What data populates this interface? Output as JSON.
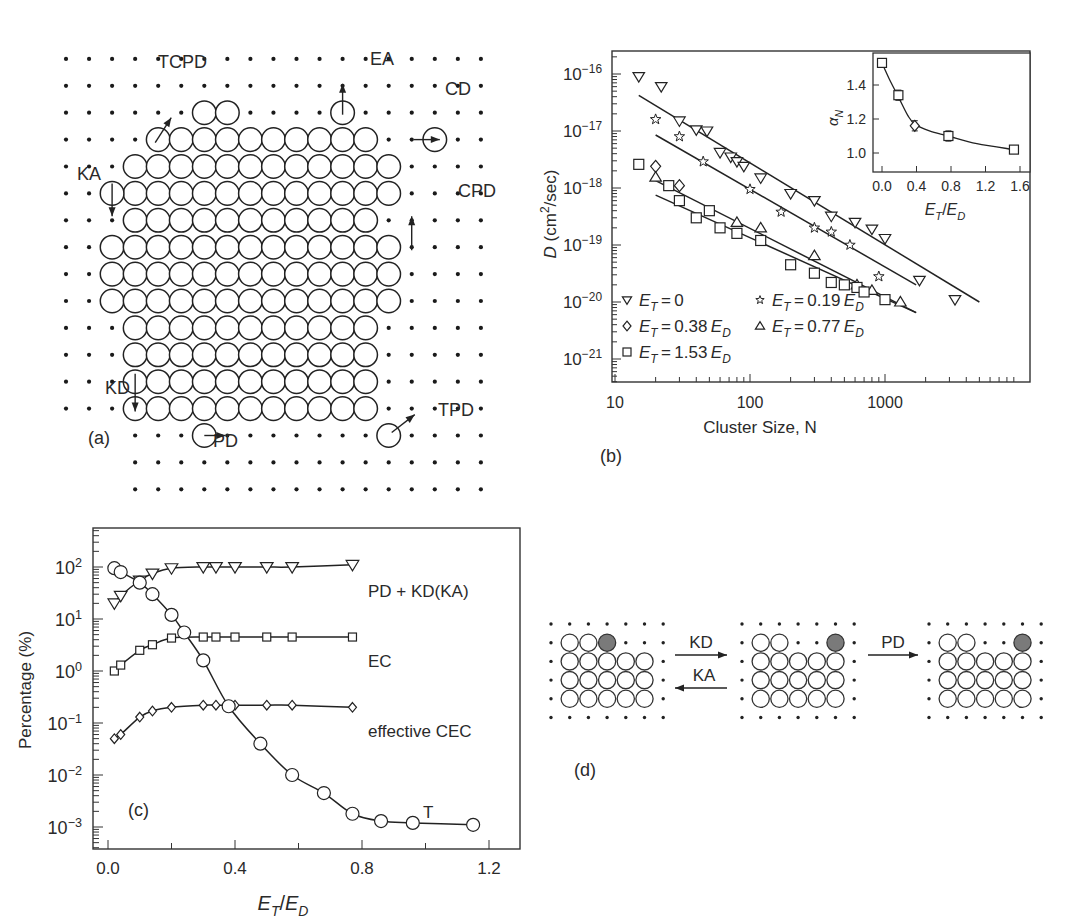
{
  "figure": {
    "panel_a": {
      "label": "(a)",
      "mechanisms": [
        "TCPD",
        "EA",
        "CD",
        "KA",
        "CPD",
        "KD",
        "PD",
        "TPD"
      ]
    },
    "panel_b": {
      "label": "(b)"
    },
    "panel_c": {
      "label": "(c)"
    },
    "panel_d": {
      "label": "(d)",
      "arrows": {
        "forward_1": "KD",
        "backward_1": "KA",
        "forward_2": "PD"
      }
    }
  },
  "chart_data": [
    {
      "panel": "b",
      "type": "scatter",
      "xscale": "log",
      "yscale": "log",
      "xlabel": "Cluster Size, N",
      "ylabel": "D (cm²/sec)",
      "xlim": [
        10,
        6000
      ],
      "ylim": [
        3e-22,
        2e-16
      ],
      "xticks": [
        "10",
        "100",
        "1000"
      ],
      "yticks": [
        "10⁻¹⁶",
        "10⁻¹⁷",
        "10⁻¹⁸",
        "10⁻¹⁹",
        "10⁻²⁰",
        "10⁻²¹"
      ],
      "legend_position": "lower left",
      "series": [
        {
          "name": "E_T = 0",
          "marker": "triangle-down",
          "x": [
            15,
            22,
            30,
            40,
            48,
            60,
            72,
            80,
            90,
            120,
            200,
            300,
            400,
            600,
            800,
            1000,
            1800,
            3300
          ],
          "y": [
            9e-17,
            6e-17,
            1.5e-17,
            1.05e-17,
            1e-17,
            4.2e-18,
            3.5e-18,
            2.9e-18,
            2.4e-18,
            1.5e-18,
            8e-19,
            6e-19,
            3.2e-19,
            2.5e-19,
            1.9e-19,
            1.3e-19,
            2.4e-20,
            1.1e-20
          ],
          "fit": {
            "x": [
              15,
              5000
            ],
            "y": [
              4.2e-17,
              1e-20
            ]
          }
        },
        {
          "name": "E_T = 0.19 E_D",
          "marker": "star",
          "x": [
            20,
            30,
            45,
            100,
            170,
            300,
            400,
            550,
            900
          ],
          "y": [
            1.6e-17,
            8e-18,
            2.9e-18,
            9.5e-19,
            3.8e-19,
            2e-19,
            1.7e-19,
            1e-19,
            2.8e-20
          ],
          "fit": {
            "x": [
              20,
              1700
            ],
            "y": [
              8.5e-18,
              2e-20
            ]
          }
        },
        {
          "name": "E_T = 0.38 E_D",
          "marker": "diamond",
          "x": [
            20,
            30
          ],
          "y": [
            2.4e-18,
            1.1e-18
          ],
          "fit": null
        },
        {
          "name": "E_T = 0.77 E_D",
          "marker": "triangle-up",
          "x": [
            20,
            80,
            120,
            300,
            620,
            800,
            1300
          ],
          "y": [
            1.55e-18,
            2.5e-19,
            2e-19,
            6.5e-20,
            2e-20,
            1.6e-20,
            1e-20
          ],
          "fit": {
            "x": [
              20,
              1700
            ],
            "y": [
              1.35e-18,
              6.5e-21
            ]
          }
        },
        {
          "name": "E_T = 1.53 E_D",
          "marker": "square",
          "x": [
            15,
            25,
            30,
            40,
            50,
            60,
            80,
            120,
            200,
            300,
            400,
            500,
            620,
            700,
            1000
          ],
          "y": [
            2.6e-18,
            1.1e-18,
            6e-19,
            3e-19,
            4e-19,
            2e-19,
            1.6e-19,
            1.2e-19,
            4.5e-20,
            3.2e-20,
            2.2e-20,
            2e-20,
            1.8e-20,
            1.5e-20,
            1.1e-20
          ],
          "fit": {
            "x": [
              20,
              1700
            ],
            "y": [
              7.5e-19,
              6.5e-21
            ]
          }
        }
      ],
      "inset": {
        "type": "line",
        "xlabel": "E_T/E_D",
        "ylabel": "α_N",
        "xlim": [
          -0.08,
          1.75
        ],
        "ylim": [
          0.9,
          1.57
        ],
        "xticks": [
          "0.0",
          "0.4",
          "0.8",
          "1.2",
          "1.6"
        ],
        "yticks": [
          "1.0",
          "1.2",
          "1.4"
        ],
        "x": [
          0.0,
          0.19,
          0.38,
          0.77,
          1.53
        ],
        "y": [
          1.53,
          1.34,
          1.16,
          1.1,
          1.02
        ],
        "markers": [
          "square",
          "square",
          "diamond",
          "square",
          "square"
        ],
        "error_bars": [
          0.0,
          0.03,
          0.03,
          0.03,
          0.0
        ]
      }
    },
    {
      "panel": "c",
      "type": "line",
      "yscale": "log",
      "xlabel": "E_T/E_D",
      "ylabel": "Percentage (%)",
      "xlim": [
        -0.03,
        1.27
      ],
      "ylim": [
        0.0003,
        500
      ],
      "xticks": [
        "0.0",
        "0.4",
        "0.8",
        "1.2"
      ],
      "yticks": [
        "10²",
        "10¹",
        "10⁰",
        "10⁻¹",
        "10⁻²",
        "10⁻³"
      ],
      "series": [
        {
          "name": "PD + KD(KA)",
          "marker": "triangle-down",
          "x": [
            0.02,
            0.04,
            0.1,
            0.14,
            0.2,
            0.3,
            0.34,
            0.4,
            0.5,
            0.58,
            0.77
          ],
          "y": [
            20,
            28,
            55,
            75,
            95,
            100,
            100,
            100,
            100,
            100,
            110
          ]
        },
        {
          "name": "EC",
          "marker": "square",
          "x": [
            0.02,
            0.04,
            0.1,
            0.14,
            0.2,
            0.3,
            0.34,
            0.4,
            0.5,
            0.58,
            0.77
          ],
          "y": [
            1.0,
            1.3,
            2.5,
            3.2,
            4.3,
            4.5,
            4.5,
            4.5,
            4.5,
            4.5,
            4.5
          ]
        },
        {
          "name": "effective CEC",
          "marker": "diamond",
          "x": [
            0.02,
            0.04,
            0.1,
            0.14,
            0.2,
            0.3,
            0.34,
            0.4,
            0.5,
            0.58,
            0.77
          ],
          "y": [
            0.05,
            0.06,
            0.13,
            0.17,
            0.2,
            0.22,
            0.22,
            0.22,
            0.22,
            0.22,
            0.2
          ]
        },
        {
          "name": "T",
          "marker": "circle",
          "x": [
            0.02,
            0.04,
            0.1,
            0.14,
            0.2,
            0.24,
            0.3,
            0.38,
            0.48,
            0.58,
            0.68,
            0.77,
            0.86,
            0.96,
            1.15
          ],
          "y": [
            95,
            80,
            50,
            30,
            12,
            5.5,
            1.6,
            0.21,
            0.04,
            0.01,
            0.0045,
            0.0018,
            0.0013,
            0.0012,
            0.0011
          ]
        }
      ]
    }
  ]
}
